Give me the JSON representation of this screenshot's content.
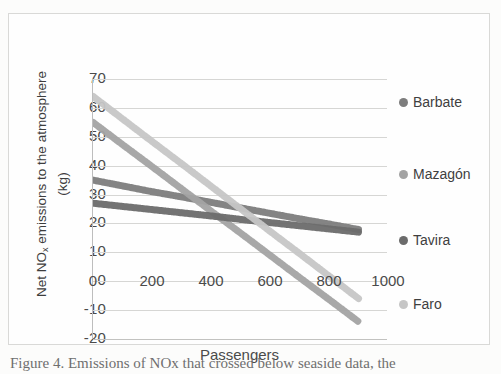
{
  "figure": {
    "caption": "Figure 4. Emissions of NOx that crossed below seaside data, the"
  },
  "chart_data": {
    "type": "line",
    "title": "",
    "xlabel": "Passengers",
    "ylabel_line1": "Net NO",
    "ylabel_sub": "x",
    "ylabel_line2": " emissions to the",
    "ylabel_line3": "atmosphere (kg)",
    "ylabel_full": "Net NOx emissions to the atmosphere (kg)",
    "xlim": [
      0,
      1000
    ],
    "ylim": [
      -20,
      70
    ],
    "xticks": [
      0,
      200,
      400,
      600,
      800,
      1000
    ],
    "yticks": [
      -20,
      -10,
      0,
      10,
      20,
      30,
      40,
      50,
      60,
      70
    ],
    "grid": true,
    "legend_position": "right",
    "series": [
      {
        "name": "Barbate",
        "color": "#7d7d7d",
        "legend_y": 20,
        "x": [
          0,
          100,
          200,
          300,
          400,
          500,
          600,
          700,
          800,
          900
        ],
        "values": [
          35.0,
          33.0,
          31.0,
          29.2,
          27.3,
          25.4,
          23.5,
          21.6,
          19.8,
          17.9
        ]
      },
      {
        "name": "Mazagón",
        "color": "#a3a3a3",
        "legend_y": 92,
        "x": [
          0,
          100,
          200,
          300,
          400,
          500,
          600,
          700,
          800,
          900
        ],
        "values": [
          55.0,
          47.3,
          39.7,
          32.0,
          24.3,
          16.7,
          9.0,
          1.3,
          -6.3,
          -14.0
        ]
      },
      {
        "name": "Tavira",
        "color": "#6b6b6b",
        "legend_y": 158,
        "x": [
          0,
          100,
          200,
          300,
          400,
          500,
          600,
          700,
          800,
          900
        ],
        "values": [
          27.0,
          25.9,
          24.8,
          23.7,
          22.6,
          21.4,
          20.3,
          19.2,
          18.1,
          17.0
        ]
      },
      {
        "name": "Faro",
        "color": "#c6c6c6",
        "legend_y": 222,
        "x": [
          0,
          100,
          200,
          300,
          400,
          500,
          600,
          700,
          800,
          900
        ],
        "values": [
          64.0,
          56.2,
          48.4,
          40.7,
          32.9,
          25.1,
          17.3,
          9.6,
          1.8,
          -6.0
        ]
      }
    ]
  }
}
